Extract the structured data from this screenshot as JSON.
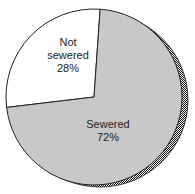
{
  "chart_data": {
    "type": "pie",
    "title": "",
    "slices": [
      {
        "label_lines": [
          "Not",
          "sewered",
          "28%"
        ],
        "name": "Not sewered",
        "value": 28,
        "color": "#ffffff"
      },
      {
        "label_lines": [
          "Sewered",
          "72%"
        ],
        "name": "Sewered",
        "value": 72,
        "color": "#c8c8c8"
      }
    ],
    "start_angle_deg": 4,
    "direction": "counterclockwise",
    "shadow": true,
    "shadow_style": "crosshatch",
    "legend": "none"
  }
}
